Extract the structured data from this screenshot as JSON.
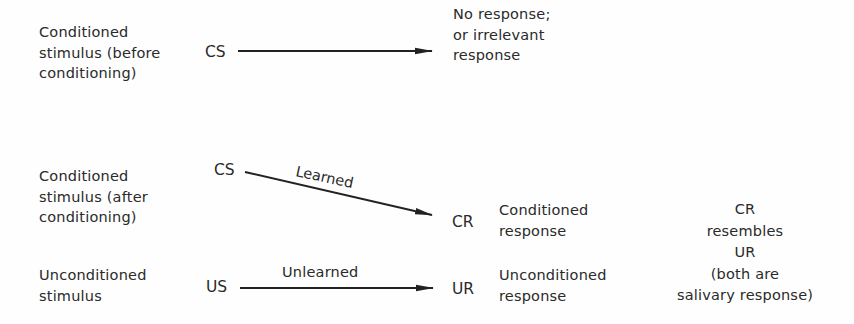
{
  "diagram": {
    "rows": [
      {
        "stimulus_label": [
          "Conditioned",
          "stimulus (before",
          "conditioning)"
        ],
        "from": "CS",
        "arrow_label": "",
        "to": "",
        "response_label": [
          "No response;",
          "or irrelevant",
          "response"
        ]
      },
      {
        "stimulus_label": [
          "Conditioned",
          "stimulus (after",
          "conditioning)"
        ],
        "from": "CS",
        "arrow_label": "Learned",
        "to": "CR",
        "response_label": [
          "Conditioned",
          "response"
        ]
      },
      {
        "stimulus_label": [
          "Unconditioned",
          "stimulus"
        ],
        "from": "US",
        "arrow_label": "Unlearned",
        "to": "UR",
        "response_label": [
          "Unconditioned",
          "response"
        ]
      }
    ],
    "note": [
      "CR",
      "resembles",
      "UR",
      "(both are",
      "salivary response)"
    ],
    "colors": {
      "ink": "#2a2a2a",
      "background": "#fefefe"
    }
  }
}
